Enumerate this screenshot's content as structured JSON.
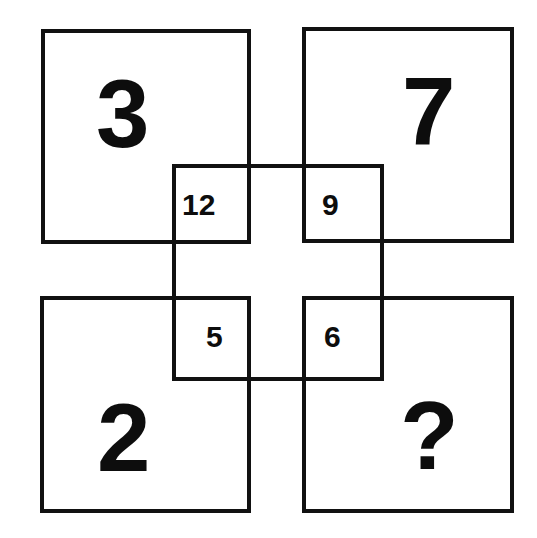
{
  "puzzle": {
    "title": "Number Square Puzzle",
    "description": "Four large squares at the corners overlap a central square; each overlap region holds a smaller number.",
    "colors": {
      "ink": "#111111",
      "background": "#ffffff"
    },
    "corner_squares": [
      {
        "position": "top-left",
        "value": "3",
        "name": "top-left-square"
      },
      {
        "position": "top-right",
        "value": "7",
        "name": "top-right-square"
      },
      {
        "position": "bottom-left",
        "value": "2",
        "name": "bottom-left-square"
      },
      {
        "position": "bottom-right",
        "value": "?",
        "name": "bottom-right-square"
      }
    ],
    "inner_cells": [
      {
        "position": "top-left",
        "value": "12",
        "name": "inner-cell-top-left"
      },
      {
        "position": "top-right",
        "value": "9",
        "name": "inner-cell-top-right"
      },
      {
        "position": "bottom-left",
        "value": "5",
        "name": "inner-cell-bottom-left"
      },
      {
        "position": "bottom-right",
        "value": "6",
        "name": "inner-cell-bottom-right"
      }
    ]
  },
  "chart_data": {
    "type": "table",
    "categories": [
      "top-left",
      "top-right",
      "bottom-left",
      "bottom-right"
    ],
    "series": [
      {
        "name": "outer",
        "values": [
          "3",
          "7",
          "2",
          "?"
        ]
      },
      {
        "name": "inner",
        "values": [
          "12",
          "9",
          "5",
          "6"
        ]
      }
    ]
  }
}
